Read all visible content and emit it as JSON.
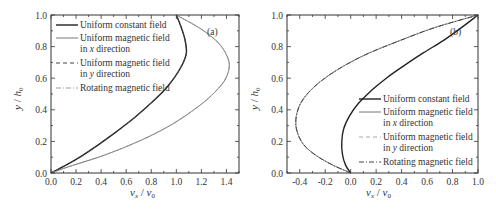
{
  "chart_data": [
    {
      "panel": "(a)",
      "type": "line",
      "title": "",
      "xlabel": "v_x / v_0",
      "ylabel": "y / h_0",
      "xlim": [
        0.0,
        1.5
      ],
      "ylim": [
        0.0,
        1.0
      ],
      "xticks": [
        "0.0",
        "0.2",
        "0.4",
        "0.6",
        "0.8",
        "1.0",
        "1.2",
        "1.4"
      ],
      "yticks": [
        "0.0",
        "0.2",
        "0.4",
        "0.6",
        "0.8",
        "1.0"
      ],
      "grid": false,
      "legend_position": "upper left",
      "series": [
        {
          "name": "Uniform constant field",
          "style": "solid",
          "color": "#222222",
          "width": 1.4,
          "x": [
            0.0,
            0.12,
            0.25,
            0.38,
            0.52,
            0.65,
            0.78,
            0.9,
            0.99,
            1.05,
            1.08,
            1.07,
            1.04,
            1.0
          ],
          "y": [
            0.0,
            0.05,
            0.11,
            0.18,
            0.26,
            0.34,
            0.43,
            0.52,
            0.61,
            0.69,
            0.76,
            0.84,
            0.92,
            1.0
          ]
        },
        {
          "name": "Uniform magnetic field in x direction",
          "style": "solid",
          "color": "#777777",
          "width": 1.0,
          "x": [
            0.0,
            0.18,
            0.38,
            0.58,
            0.78,
            0.97,
            1.14,
            1.28,
            1.38,
            1.42,
            1.41,
            1.34,
            1.2,
            1.0
          ],
          "y": [
            0.0,
            0.05,
            0.1,
            0.16,
            0.23,
            0.31,
            0.4,
            0.49,
            0.58,
            0.66,
            0.73,
            0.82,
            0.91,
            1.0
          ]
        },
        {
          "name": "Uniform magnetic field in y direction",
          "style": "dashed",
          "color": "#444444",
          "width": 1.0,
          "x": [
            0.0,
            0.12,
            0.25,
            0.38,
            0.52,
            0.65,
            0.78,
            0.9,
            0.99,
            1.05,
            1.08,
            1.07,
            1.04,
            1.0
          ],
          "y": [
            0.0,
            0.05,
            0.11,
            0.18,
            0.26,
            0.34,
            0.43,
            0.52,
            0.61,
            0.69,
            0.76,
            0.84,
            0.92,
            1.0
          ]
        },
        {
          "name": "Rotating magnetic field",
          "style": "dashdot",
          "color": "#999999",
          "width": 1.0,
          "x": [
            0.0,
            0.18,
            0.38,
            0.58,
            0.78,
            0.97,
            1.14,
            1.28,
            1.38,
            1.42,
            1.41,
            1.34,
            1.2,
            1.0
          ],
          "y": [
            0.0,
            0.05,
            0.1,
            0.16,
            0.23,
            0.31,
            0.4,
            0.49,
            0.58,
            0.66,
            0.73,
            0.82,
            0.91,
            1.0
          ]
        }
      ]
    },
    {
      "panel": "(b)",
      "type": "line",
      "title": "",
      "xlabel": "v_x / v_0",
      "ylabel": "y / h_0",
      "xlim": [
        -0.5,
        1.0
      ],
      "ylim": [
        0.0,
        1.0
      ],
      "xticks": [
        "-0.4",
        "-0.2",
        "0.0",
        "0.2",
        "0.4",
        "0.6",
        "0.8",
        "1.0"
      ],
      "yticks": [
        "0.0",
        "0.2",
        "0.4",
        "0.6",
        "0.8",
        "1.0"
      ],
      "grid": false,
      "legend_position": "lower right",
      "series": [
        {
          "name": "Uniform constant field",
          "style": "solid",
          "color": "#222222",
          "width": 1.4,
          "x": [
            0.0,
            -0.04,
            -0.065,
            -0.07,
            -0.055,
            -0.01,
            0.06,
            0.16,
            0.28,
            0.42,
            0.57,
            0.73,
            0.87,
            1.0
          ],
          "y": [
            0.0,
            0.05,
            0.12,
            0.2,
            0.28,
            0.36,
            0.44,
            0.52,
            0.6,
            0.68,
            0.76,
            0.84,
            0.92,
            1.0
          ]
        },
        {
          "name": "Uniform magnetic field in x direction",
          "style": "solid",
          "color": "#777777",
          "width": 1.0,
          "x": [
            0.0,
            -0.14,
            -0.27,
            -0.37,
            -0.42,
            -0.43,
            -0.4,
            -0.33,
            -0.22,
            -0.07,
            0.12,
            0.36,
            0.66,
            1.0
          ],
          "y": [
            0.0,
            0.05,
            0.11,
            0.18,
            0.26,
            0.34,
            0.43,
            0.51,
            0.59,
            0.67,
            0.75,
            0.83,
            0.92,
            1.0
          ]
        },
        {
          "name": "Uniform magnetic field in y direction",
          "style": "dashed",
          "color": "#aaaaaa",
          "width": 1.0,
          "x": [
            0.0,
            -0.14,
            -0.27,
            -0.37,
            -0.42,
            -0.43,
            -0.4,
            -0.33,
            -0.22,
            -0.07,
            0.12,
            0.36,
            0.66,
            1.0
          ],
          "y": [
            0.0,
            0.05,
            0.11,
            0.18,
            0.26,
            0.34,
            0.43,
            0.51,
            0.59,
            0.67,
            0.75,
            0.83,
            0.92,
            1.0
          ]
        },
        {
          "name": "Rotating magnetic field",
          "style": "dashdot",
          "color": "#444444",
          "width": 1.0,
          "x": [
            0.0,
            -0.14,
            -0.27,
            -0.37,
            -0.42,
            -0.43,
            -0.4,
            -0.33,
            -0.22,
            -0.07,
            0.12,
            0.36,
            0.66,
            1.0
          ],
          "y": [
            0.0,
            0.05,
            0.11,
            0.18,
            0.26,
            0.34,
            0.43,
            0.51,
            0.59,
            0.67,
            0.75,
            0.83,
            0.92,
            1.0
          ]
        }
      ]
    }
  ],
  "panels": [
    {
      "tag": "(a)",
      "x_axis_label": "v",
      "x_axis_sub": "x",
      "x_axis_sep": " / ",
      "x_axis_label2": "v",
      "x_axis_sub2": "0",
      "y_axis_label": "y",
      "y_axis_sep": " / ",
      "y_axis_label2": "h",
      "y_axis_sub2": "0",
      "legend": [
        {
          "line1": "Uniform constant field"
        },
        {
          "line1": "Uniform magnetic field",
          "line2_pre": "in ",
          "line2_var": "x",
          "line2_post": " direction"
        },
        {
          "line1": "Uniform magnetic field",
          "line2_pre": "in ",
          "line2_var": "y",
          "line2_post": " direction"
        },
        {
          "line1": "Rotating magnetic field"
        }
      ]
    },
    {
      "tag": "(b)",
      "x_axis_label": "v",
      "x_axis_sub": "x",
      "x_axis_sep": " / ",
      "x_axis_label2": "v",
      "x_axis_sub2": "0",
      "y_axis_label": "y",
      "y_axis_sep": " / ",
      "y_axis_label2": "h",
      "y_axis_sub2": "0",
      "legend": [
        {
          "line1": "Uniform constant field"
        },
        {
          "line1": "Uniform magnetic field",
          "line2_pre": "in ",
          "line2_var": "x",
          "line2_post": " direction"
        },
        {
          "line1": "Uniform magnetic field",
          "line2_pre": "in ",
          "line2_var": "y",
          "line2_post": " direction"
        },
        {
          "line1": "Rotating magnetic field"
        }
      ]
    }
  ]
}
